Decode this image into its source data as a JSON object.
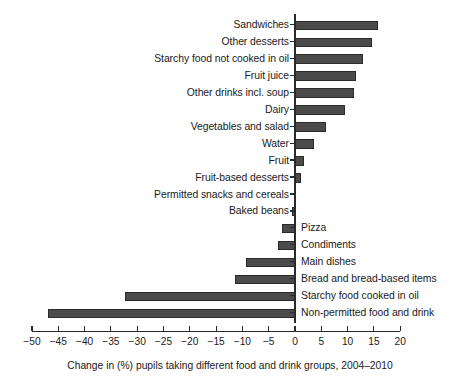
{
  "chart_data": {
    "type": "bar",
    "orientation": "horizontal",
    "title": "",
    "xlabel": "Change in (%) pupils taking different food and drink groups, 2004–2010",
    "ylabel": "",
    "xlim": [
      -52,
      22
    ],
    "xticks": [
      -50,
      -45,
      -40,
      -35,
      -30,
      -25,
      -20,
      -15,
      -10,
      -5,
      0,
      5,
      10,
      15,
      20
    ],
    "xtick_labels": [
      "−50",
      "−45",
      "−40",
      "−35",
      "−30",
      "−25",
      "−20",
      "−15",
      "−10",
      "−5",
      "0",
      "5",
      "10",
      "15",
      "20"
    ],
    "grid": false,
    "legend": null,
    "bar_color": "#4b4b4b",
    "bar_edge_color": "#2b2b2b",
    "categories": [
      "Sandwiches",
      "Other desserts",
      "Starchy food not cooked in oil",
      "Fruit juice",
      "Other drinks incl. soup",
      "Dairy",
      "Vegetables and salad",
      "Water",
      "Fruit",
      "Fruit-based desserts",
      "Permitted snacks and cereals",
      "Baked beans",
      "Pizza",
      "Condiments",
      "Main dishes",
      "Bread and bread-based items",
      "Starchy food cooked in oil",
      "Non-permitted food and drink"
    ],
    "values": [
      15.7,
      14.6,
      12.9,
      11.6,
      11.2,
      9.6,
      5.9,
      3.6,
      1.7,
      1.1,
      0.1,
      -0.6,
      -2.5,
      -3.2,
      -9.3,
      -11.5,
      -32.3,
      -47.0
    ],
    "label_side": [
      "left",
      "left",
      "left",
      "left",
      "left",
      "left",
      "left",
      "left",
      "left",
      "left",
      "left",
      "left",
      "right",
      "right",
      "right",
      "right",
      "right",
      "right"
    ]
  },
  "caption": {
    "text": "Change in (%) pupils taking different food and drink groups, 2004–2010"
  }
}
